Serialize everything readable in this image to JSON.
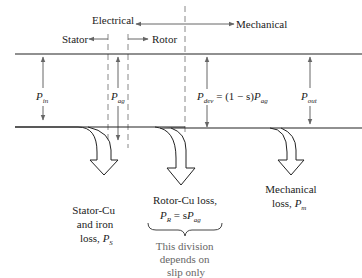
{
  "diagram": {
    "regions": {
      "electrical": "Electrical",
      "mechanical": "Mechanical",
      "stator": "Stator",
      "rotor": "Rotor"
    },
    "powers": {
      "p_in": {
        "symbol": "P",
        "sub": "in"
      },
      "p_ag": {
        "symbol": "P",
        "sub": "ag"
      },
      "p_dev": {
        "symbol": "P",
        "sub": "dev",
        "expr_mid": " = (1 − s)",
        "expr_sym": "P",
        "expr_sub": "ag"
      },
      "p_out": {
        "symbol": "P",
        "sub": "out"
      }
    },
    "losses": {
      "stator": {
        "line1": "Stator-Cu",
        "line2": "and iron",
        "line3": "loss, ",
        "sym": "P",
        "sub": "S"
      },
      "rotor": {
        "line1": "Rotor-Cu loss,",
        "sym": "P",
        "sub": "R",
        "eq": " = s",
        "sym2": "P",
        "sub2": "ag"
      },
      "mechanical": {
        "line1": "Mechanical",
        "line2": "loss, ",
        "sym": "P",
        "sub": "m"
      }
    },
    "note": {
      "line1": "This division",
      "line2": "depends on",
      "line3": "slip only"
    },
    "colors": {
      "line": "#222222",
      "arrow": "#666666",
      "dash": "#888888",
      "note": "#777777"
    }
  }
}
